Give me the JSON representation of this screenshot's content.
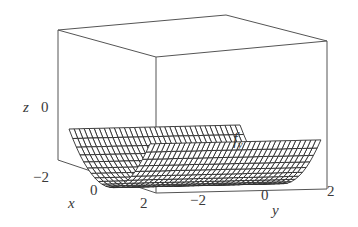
{
  "chart_data": {
    "type": "surface",
    "title": "",
    "function_label": "f_y",
    "xlabel": "x",
    "ylabel": "y",
    "zlabel": "z",
    "x_ticks": [
      "-2",
      "0",
      "2"
    ],
    "y_ticks": [
      "-2",
      "0",
      "2"
    ],
    "z_ticks": [
      "0"
    ],
    "xlim": [
      -2,
      2
    ],
    "ylim": [
      -2,
      2
    ],
    "grid": false,
    "box": true,
    "colors": {
      "mesh": "#2b2b2b",
      "box": "#555555",
      "background": "#ffffff"
    }
  },
  "labels": {
    "z_axis": "z",
    "z_tick_0": "0",
    "x_tick_m2": "−2",
    "x_tick_0": "0",
    "x_tick_2": "2",
    "x_axis": "x",
    "y_tick_m2": "−2",
    "y_tick_0": "0",
    "y_tick_2": "2",
    "y_axis": "y",
    "func_f": "f",
    "func_sub": "y"
  }
}
